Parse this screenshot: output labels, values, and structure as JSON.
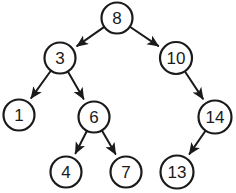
{
  "figure": {
    "width": 236,
    "height": 193,
    "background_color": "#ffffff",
    "stroke_color": "#1a1a1a",
    "text_color": "#1a1a1a",
    "node_fill": "#ffffff",
    "node_stroke_width": 2.2,
    "edge_stroke_width": 2.0,
    "node_radius": 16,
    "label_font_size": 17
  },
  "chart_data": {
    "type": "diagram",
    "subtype": "directed-tree",
    "root": "8",
    "nodes": [
      {
        "id": "n8",
        "label": "8",
        "x": 117,
        "y": 18,
        "r": 15.5,
        "level": 0
      },
      {
        "id": "n3",
        "label": "3",
        "x": 60,
        "y": 58,
        "r": 15.5,
        "level": 1
      },
      {
        "id": "n10",
        "label": "10",
        "x": 176,
        "y": 58,
        "r": 16.0,
        "level": 1
      },
      {
        "id": "n1",
        "label": "1",
        "x": 19,
        "y": 115,
        "r": 15.5,
        "level": 2
      },
      {
        "id": "n6",
        "label": "6",
        "x": 94,
        "y": 117,
        "r": 15.5,
        "level": 2
      },
      {
        "id": "n14",
        "label": "14",
        "x": 215,
        "y": 117,
        "r": 16.5,
        "level": 2
      },
      {
        "id": "n4",
        "label": "4",
        "x": 66,
        "y": 172,
        "r": 15.5,
        "level": 3
      },
      {
        "id": "n7",
        "label": "7",
        "x": 126,
        "y": 172,
        "r": 15.5,
        "level": 3
      },
      {
        "id": "n13",
        "label": "13",
        "x": 177,
        "y": 172,
        "r": 16.5,
        "level": 3
      }
    ],
    "edges": [
      {
        "from": "n8",
        "to": "n3",
        "from_label": "8",
        "to_label": "3",
        "arrow": true,
        "side": "left"
      },
      {
        "from": "n8",
        "to": "n10",
        "from_label": "8",
        "to_label": "10",
        "arrow": true,
        "side": "right"
      },
      {
        "from": "n3",
        "to": "n1",
        "from_label": "3",
        "to_label": "1",
        "arrow": true,
        "side": "left"
      },
      {
        "from": "n3",
        "to": "n6",
        "from_label": "3",
        "to_label": "6",
        "arrow": true,
        "side": "right"
      },
      {
        "from": "n10",
        "to": "n14",
        "from_label": "10",
        "to_label": "14",
        "arrow": true,
        "side": "right"
      },
      {
        "from": "n6",
        "to": "n4",
        "from_label": "6",
        "to_label": "4",
        "arrow": true,
        "side": "left"
      },
      {
        "from": "n6",
        "to": "n7",
        "from_label": "6",
        "to_label": "7",
        "arrow": true,
        "side": "right"
      },
      {
        "from": "n14",
        "to": "n13",
        "from_label": "14",
        "to_label": "13",
        "arrow": true,
        "side": "left"
      }
    ],
    "node_values": [
      8,
      3,
      10,
      1,
      6,
      14,
      4,
      7,
      13
    ],
    "legend": [],
    "annotations": []
  }
}
